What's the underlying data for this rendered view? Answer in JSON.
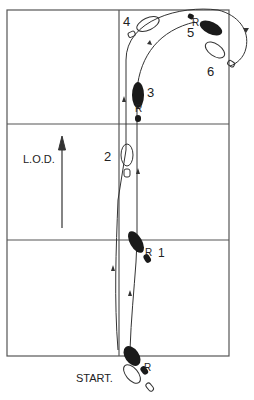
{
  "diagram": {
    "type": "dance-step-floor-pattern",
    "colors": {
      "ink": "#2a2a2a",
      "background": "#ffffff",
      "frame": "#555555"
    },
    "labels": {
      "start": "START.",
      "direction": "L.O.D.",
      "steps": [
        "1",
        "2",
        "3",
        "4",
        "5",
        "6"
      ],
      "foot_marker": "R"
    },
    "steps": [
      {
        "number": "1",
        "foot": "right",
        "filled": true
      },
      {
        "number": "2",
        "foot": "left",
        "filled": false
      },
      {
        "number": "3",
        "foot": "right",
        "filled": true
      },
      {
        "number": "4",
        "foot": "left",
        "filled": false
      },
      {
        "number": "5",
        "foot": "right",
        "filled": true
      },
      {
        "number": "6",
        "foot": "left",
        "filled": false
      }
    ]
  }
}
